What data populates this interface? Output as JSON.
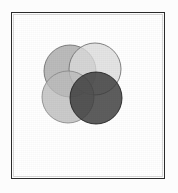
{
  "figure": {
    "caption": "",
    "background_color": "#ffffff",
    "frame_color": "#2b2b2b",
    "frame_style": "thin rectangular plate border"
  },
  "chart_data": {
    "type": "diagram",
    "subtype": "venn",
    "xlabel": "",
    "ylabel": "",
    "grid": false,
    "legend": "none",
    "set_count": 4,
    "blend_mode": "multiply",
    "canvas": {
      "width": 154,
      "height": 167
    },
    "circle_radius": 26,
    "sets": [
      {
        "name": "top-left-circle",
        "label": "",
        "cx": 59,
        "cy": 59,
        "r": 26,
        "fill": "#a8a8a8",
        "stroke": "#6e6e6e",
        "opacity": 0.78
      },
      {
        "name": "top-right-circle",
        "label": "",
        "cx": 84,
        "cy": 57,
        "r": 26,
        "fill": "#dcdcdc",
        "stroke": "#707070",
        "opacity": 0.78
      },
      {
        "name": "bottom-left-circle",
        "label": "",
        "cx": 57,
        "cy": 85,
        "r": 26,
        "fill": "#bdbdbd",
        "stroke": "#8a8a8a",
        "opacity": 0.78
      },
      {
        "name": "bottom-right-circle",
        "label": "",
        "cx": 85,
        "cy": 86,
        "r": 26,
        "fill": "#3a3a3a",
        "stroke": "#1f1f1f",
        "opacity": 0.82
      }
    ],
    "sampled_region_colors": [
      {
        "region": "top-left only",
        "hex": "#a8a8a8"
      },
      {
        "region": "top-right only",
        "hex": "#d8d8d8"
      },
      {
        "region": "bottom-left only",
        "hex": "#b4b4b4"
      },
      {
        "region": "bottom-right only",
        "hex": "#3a3a3a"
      },
      {
        "region": "top-left ∩ top-right",
        "hex": "#9b9b9b"
      },
      {
        "region": "center (all four)",
        "hex": "#2e2e2e"
      },
      {
        "region": "background",
        "hex": "#ffffff"
      }
    ]
  }
}
